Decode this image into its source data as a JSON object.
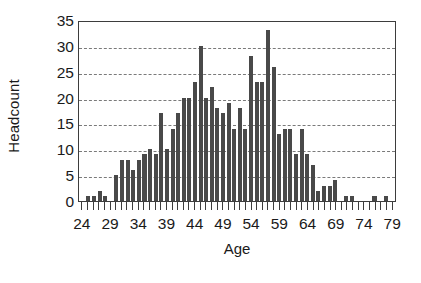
{
  "chart_data": {
    "type": "bar",
    "title": "",
    "xlabel": "Age",
    "ylabel": "Headcount",
    "xlim": [
      23.5,
      79.5
    ],
    "ylim": [
      0,
      35
    ],
    "ytick_values": [
      0,
      5,
      10,
      15,
      20,
      25,
      30,
      35
    ],
    "ytick_labels": [
      "0",
      "5",
      "10",
      "15",
      "20",
      "25",
      "30",
      "35"
    ],
    "xtick_labels": [
      "24",
      "29",
      "34",
      "39",
      "44",
      "49",
      "54",
      "59",
      "64",
      "69",
      "74",
      "79"
    ],
    "xtick_values": [
      24,
      29,
      34,
      39,
      44,
      49,
      54,
      59,
      64,
      69,
      74,
      79
    ],
    "grid": "horizontal-dashed",
    "legend": "none",
    "bar_color": "#494949",
    "axis_color": "#3d3d3d",
    "gridline_color": "#7a7a7a",
    "background_color": "#ffffff",
    "categories": [
      24,
      25,
      26,
      27,
      28,
      29,
      30,
      31,
      32,
      33,
      34,
      35,
      36,
      37,
      38,
      39,
      40,
      41,
      42,
      43,
      44,
      45,
      46,
      47,
      48,
      49,
      50,
      51,
      52,
      53,
      54,
      55,
      56,
      57,
      58,
      59,
      60,
      61,
      62,
      63,
      64,
      65,
      66,
      67,
      68,
      69,
      70,
      71,
      72,
      73,
      74,
      75,
      76,
      77,
      78,
      79
    ],
    "values": [
      0,
      1,
      1,
      2,
      1,
      0,
      5,
      8,
      8,
      6,
      8,
      9,
      10,
      9,
      17,
      10,
      14,
      17,
      20,
      20,
      23,
      30,
      20,
      22,
      18,
      17,
      19,
      14,
      18,
      14,
      28,
      23,
      23,
      33,
      26,
      13,
      14,
      14,
      9,
      14,
      9,
      7,
      2,
      3,
      3,
      4,
      0,
      1,
      1,
      0,
      0,
      0,
      1,
      0,
      1,
      0
    ]
  },
  "axes": {
    "ylabel": "Headcount",
    "xlabel": "Age"
  }
}
